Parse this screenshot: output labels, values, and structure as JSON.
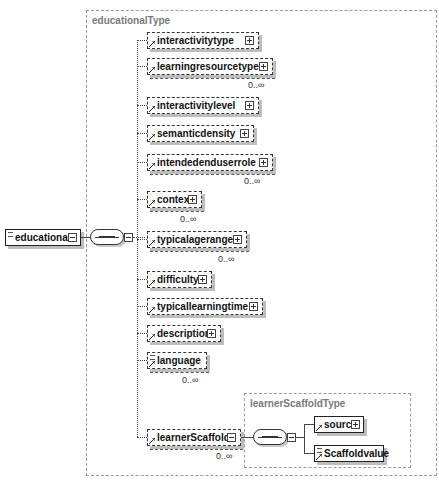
{
  "diagram": {
    "root_element": {
      "name": "educational",
      "required": true,
      "simple_marker": true
    },
    "outer_type": {
      "label": "educationalType"
    },
    "children": [
      {
        "name": "interactivitytype",
        "required": false,
        "expandable": true,
        "cardinality": ""
      },
      {
        "name": "learningresourcetype",
        "required": false,
        "expandable": true,
        "cardinality": "0..∞"
      },
      {
        "name": "interactivitylevel",
        "required": false,
        "expandable": true,
        "cardinality": ""
      },
      {
        "name": "semanticdensity",
        "required": false,
        "expandable": true,
        "cardinality": ""
      },
      {
        "name": "intendedenduserrole",
        "required": false,
        "expandable": true,
        "cardinality": "0..∞"
      },
      {
        "name": "context",
        "required": false,
        "expandable": true,
        "cardinality": "0..∞"
      },
      {
        "name": "typicalagerange",
        "required": false,
        "expandable": true,
        "cardinality": "0..∞"
      },
      {
        "name": "difficulty",
        "required": false,
        "expandable": true,
        "cardinality": ""
      },
      {
        "name": "typicallearningtime",
        "required": false,
        "expandable": true,
        "cardinality": ""
      },
      {
        "name": "description",
        "required": false,
        "expandable": true,
        "cardinality": ""
      },
      {
        "name": "language",
        "required": false,
        "expandable": false,
        "cardinality": "0..∞"
      },
      {
        "name": "learnerScaffold",
        "required": false,
        "expandable": false,
        "expanded": true,
        "cardinality": "0..∞"
      }
    ],
    "inner_type": {
      "label": "learnerScaffoldType",
      "children": [
        {
          "name": "source",
          "required": true,
          "expandable": true
        },
        {
          "name": "Scaffoldvalue",
          "required": true,
          "expandable": false
        }
      ]
    },
    "compositor": "sequence"
  }
}
